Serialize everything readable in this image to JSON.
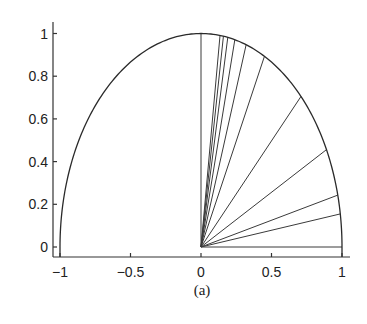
{
  "chart_data": {
    "type": "line",
    "title": "",
    "caption": "(a)",
    "xlabel": "",
    "ylabel": "",
    "xlim": [
      -1,
      1
    ],
    "ylim": [
      0,
      1
    ],
    "grid": false,
    "legend": null,
    "x_ticks": [
      {
        "value": -1,
        "label": "−1"
      },
      {
        "value": -0.5,
        "label": "−0.5"
      },
      {
        "value": 0,
        "label": "0"
      },
      {
        "value": 0.5,
        "label": "0.5"
      },
      {
        "value": 1,
        "label": "1"
      }
    ],
    "y_ticks": [
      {
        "value": 0,
        "label": "0"
      },
      {
        "value": 0.2,
        "label": "0.2"
      },
      {
        "value": 0.4,
        "label": "0.4"
      },
      {
        "value": 0.6,
        "label": "0.6"
      },
      {
        "value": 0.8,
        "label": "0.8"
      },
      {
        "value": 1,
        "label": "1"
      }
    ],
    "series": [
      {
        "name": "unit semicircle",
        "kind": "curve",
        "description": "Upper half of unit circle x^2 + y^2 = 1 from x=-1 to x=1"
      },
      {
        "name": "rays from origin",
        "kind": "segments",
        "origin": [
          0,
          0
        ],
        "endpoints_x": [
          0,
          0.135,
          0.159,
          0.19,
          0.24,
          0.32,
          0.45,
          0.709,
          0.89,
          0.97,
          0.988,
          1.0
        ],
        "endpoints_y": [
          1,
          0.991,
          0.987,
          0.982,
          0.971,
          0.947,
          0.893,
          0.705,
          0.456,
          0.243,
          0.155,
          0.0
        ]
      }
    ]
  },
  "colors": {
    "curve": "#2a2a2a",
    "rays": "#3a3a3a",
    "axis": "#333333",
    "background": "#ffffff"
  }
}
